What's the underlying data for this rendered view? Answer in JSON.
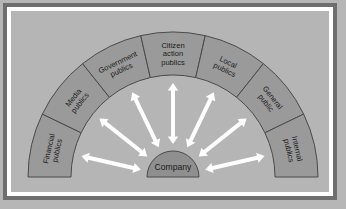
{
  "diagram": {
    "type": "radial-segment-diagram",
    "hub": {
      "label": "Company",
      "shape": "semicircle-dome",
      "fill": "#8f8f8f"
    },
    "colors": {
      "page_background": "#b6b6b6",
      "outer_border": "#6e6e6e",
      "white_gap": "#ffffff",
      "panel_background": "#b5b5b5",
      "ring_fill": "#9a9a9a",
      "ring_stroke": "#4a4a4a",
      "arrow_fill": "#ffffff",
      "text": "#1b1b1b"
    },
    "geometry": {
      "center_x": 173,
      "center_y": 177,
      "outer_radius": 145,
      "inner_radius": 102,
      "hub_radius": 26,
      "arc_start_deg": 180,
      "arc_end_deg": 360,
      "segment_count": 7
    },
    "segments": [
      {
        "id": "financial-publics",
        "label": "Financial publics",
        "lines": [
          "Financial",
          "publics"
        ]
      },
      {
        "id": "media-publics",
        "label": "Media publics",
        "lines": [
          "Media",
          "publics"
        ]
      },
      {
        "id": "government-publics",
        "label": "Government publics",
        "lines": [
          "Government",
          "publics"
        ]
      },
      {
        "id": "citizen-action-publics",
        "label": "Citizen action publics",
        "lines": [
          "Citizen",
          "action",
          "publics"
        ]
      },
      {
        "id": "local-publics",
        "label": "Local publics",
        "lines": [
          "Local",
          "publics"
        ]
      },
      {
        "id": "general-public",
        "label": "General public",
        "lines": [
          "General",
          "public"
        ]
      },
      {
        "id": "internal-publics",
        "label": "Internal publics",
        "lines": [
          "Internal",
          "publics"
        ]
      }
    ],
    "arrows": {
      "count": 7,
      "style": "double-headed",
      "direction": "radial from hub to each segment",
      "color": "#ffffff"
    }
  }
}
